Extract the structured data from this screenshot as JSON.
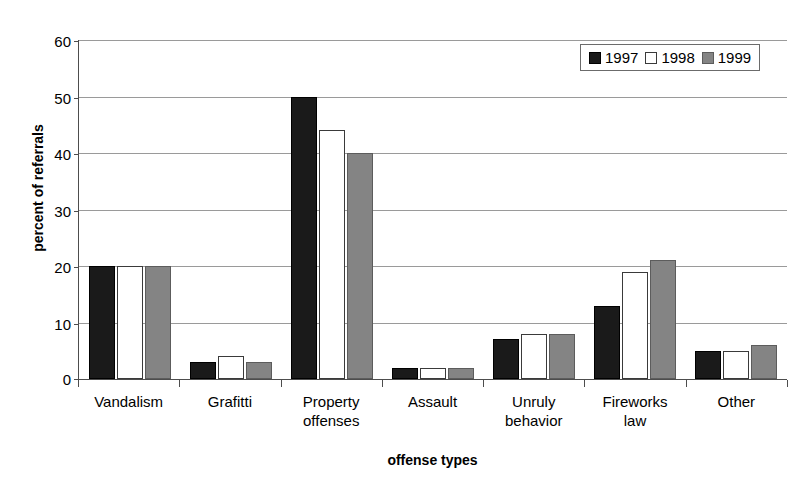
{
  "chart_data": {
    "type": "bar",
    "title": "",
    "xlabel": "offense types",
    "ylabel": "percent of referrals",
    "ylim": [
      0,
      60
    ],
    "yticks": [
      0,
      10,
      20,
      30,
      40,
      50,
      60
    ],
    "grid": true,
    "legend_position": "top-right",
    "categories": [
      "Vandalism",
      "Grafitti",
      "Property\noffenses",
      "Assault",
      "Unruly\nbehavior",
      "Fireworks\nlaw",
      "Other"
    ],
    "series": [
      {
        "name": "1997",
        "color": "#1a1a1a",
        "values": [
          20,
          3,
          50,
          2,
          7,
          13,
          5
        ]
      },
      {
        "name": "1998",
        "color": "#ffffff",
        "values": [
          20,
          4,
          44,
          2,
          8,
          19,
          5
        ]
      },
      {
        "name": "1999",
        "color": "#848484",
        "values": [
          20,
          3,
          40,
          2,
          8,
          21,
          6
        ]
      }
    ]
  },
  "legend": {
    "items": [
      {
        "label": "1997"
      },
      {
        "label": "1998"
      },
      {
        "label": "1999"
      }
    ]
  },
  "axes": {
    "y_title": "percent of referrals",
    "x_title": "offense types"
  }
}
